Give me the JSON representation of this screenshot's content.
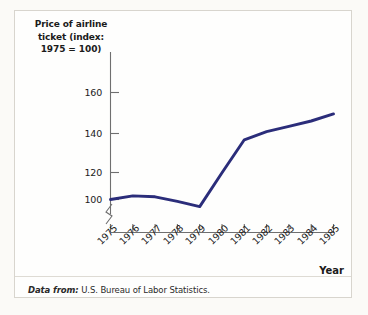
{
  "figure": {
    "y_axis_title": "Price of airline ticket (index: 1975 = 100)",
    "y_axis_title_lines": [
      "Price of airline",
      "ticket (index:",
      "1975 = 100)"
    ],
    "x_axis_title": "Year",
    "footnote_label": "Data from:",
    "footnote_text": "U.S. Bureau of Labor Statistics.",
    "line_color": "#2b2d7a",
    "axis_color": "#6f6f6f",
    "frame_color": "#d8d5ce",
    "background_color": "#fefefd"
  },
  "chart_data": {
    "type": "line",
    "title": "",
    "xlabel": "Year",
    "ylabel": "Price of airline ticket (index: 1975 = 100)",
    "x": [
      1975,
      1976,
      1977,
      1978,
      1979,
      1980,
      1981,
      1982,
      1983,
      1984,
      1985
    ],
    "categories": [
      "1975",
      "1976",
      "1977",
      "1978",
      "1979",
      "1980",
      "1981",
      "1982",
      "1983",
      "1984",
      "1985"
    ],
    "values": [
      100,
      102,
      101.5,
      99,
      96,
      115,
      133.5,
      138,
      141,
      144,
      148
    ],
    "series": [
      {
        "name": "Airline ticket price index",
        "values": [
          100,
          102,
          101.5,
          99,
          96,
          115,
          133.5,
          138,
          141,
          144,
          148
        ]
      }
    ],
    "yticks": [
      100,
      120,
      140,
      160
    ],
    "ytick_labels": [
      "100",
      "120",
      "140",
      "160"
    ],
    "xtick_labels": [
      "1975",
      "1976",
      "1977",
      "1978",
      "1979",
      "1980",
      "1981",
      "1982",
      "1983",
      "1984",
      "1985"
    ],
    "ylim": [
      92,
      168
    ],
    "xlim": [
      1975,
      1985
    ],
    "grid": false,
    "legend": false,
    "axis_break": true,
    "axis_break_axis": "y",
    "note": "y-axis is broken below 100"
  }
}
